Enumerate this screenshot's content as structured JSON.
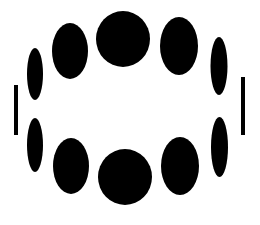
{
  "figure": {
    "background": "#ffffff",
    "fill": "#000000",
    "width": 260,
    "height": 225
  },
  "ellipses": [
    {
      "name": "top-center-circle",
      "cx": 123,
      "cy": 39,
      "rx": 27,
      "ry": 28
    },
    {
      "name": "top-left-ellipse",
      "cx": 70,
      "cy": 51,
      "rx": 18,
      "ry": 28
    },
    {
      "name": "top-right-ellipse",
      "cx": 179,
      "cy": 46,
      "rx": 19,
      "ry": 29
    },
    {
      "name": "upper-far-left-ellipse",
      "cx": 35,
      "cy": 74,
      "rx": 8,
      "ry": 26
    },
    {
      "name": "upper-far-right-ellipse",
      "cx": 219,
      "cy": 66,
      "rx": 8.5,
      "ry": 29
    },
    {
      "name": "lower-far-left-ellipse",
      "cx": 35,
      "cy": 145,
      "rx": 8,
      "ry": 27
    },
    {
      "name": "lower-far-right-ellipse",
      "cx": 219.5,
      "cy": 147,
      "rx": 8.5,
      "ry": 30
    },
    {
      "name": "bottom-left-ellipse",
      "cx": 71,
      "cy": 166,
      "rx": 18,
      "ry": 28
    },
    {
      "name": "bottom-right-ellipse",
      "cx": 180,
      "cy": 166,
      "rx": 19,
      "ry": 29
    },
    {
      "name": "bottom-center-circle",
      "cx": 125,
      "cy": 177,
      "rx": 27,
      "ry": 28
    }
  ],
  "bars": [
    {
      "name": "left-vertical-bar",
      "x": 14,
      "y": 85,
      "width": 4,
      "height": 50
    },
    {
      "name": "right-vertical-bar",
      "x": 241,
      "y": 77,
      "width": 4,
      "height": 58
    }
  ]
}
